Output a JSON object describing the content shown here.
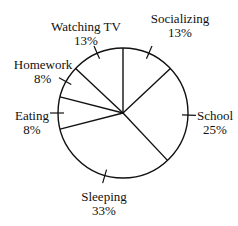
{
  "chart_data": {
    "type": "pie",
    "title": "",
    "start_angle_deg": 0,
    "direction": "clockwise",
    "slices": [
      {
        "label": "Socializing",
        "value": 13,
        "display": "13%"
      },
      {
        "label": "School",
        "value": 25,
        "display": "25%"
      },
      {
        "label": "Sleeping",
        "value": 33,
        "display": "33%"
      },
      {
        "label": "Eating",
        "value": 8,
        "display": "8%"
      },
      {
        "label": "Homework",
        "value": 8,
        "display": "8%"
      },
      {
        "label": "Watching TV",
        "value": 13,
        "display": "13%"
      }
    ],
    "fill": "#ffffff",
    "stroke": "#111111",
    "legend": "none (leader-line labels)"
  },
  "labels": {
    "socializing": {
      "name": "Socializing",
      "pct": "13%"
    },
    "school": {
      "name": "School",
      "pct": "25%"
    },
    "sleeping": {
      "name": "Sleeping",
      "pct": "33%"
    },
    "eating": {
      "name": "Eating",
      "pct": "8%"
    },
    "homework": {
      "name": "Homework",
      "pct": "8%"
    },
    "watching_tv": {
      "name": "Watching TV",
      "pct": "13%"
    }
  }
}
